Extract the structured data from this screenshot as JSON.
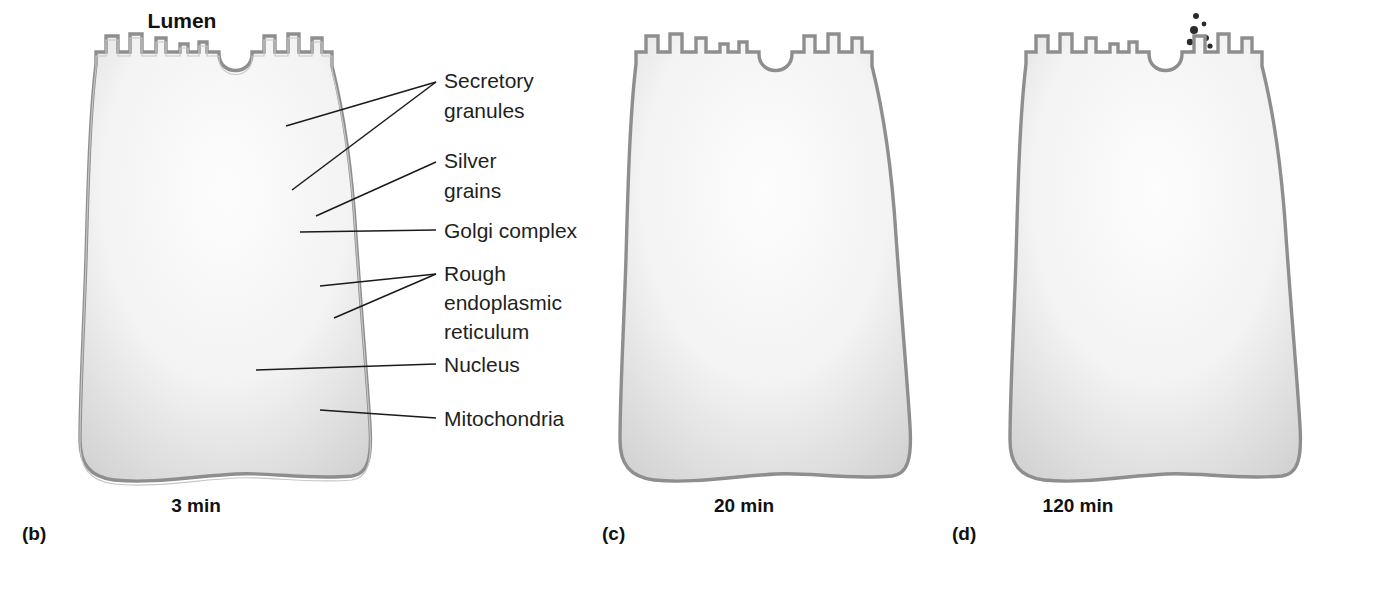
{
  "figure": {
    "lumen_title": "Lumen",
    "background_color": "#ffffff"
  },
  "callouts": [
    {
      "id": "secretory-granules",
      "lines": [
        "Secretory",
        "granules"
      ],
      "x": 444,
      "y": 88
    },
    {
      "id": "silver-grains",
      "lines": [
        "Silver",
        "grains"
      ],
      "x": 444,
      "y": 168
    },
    {
      "id": "golgi-complex",
      "lines": [
        "Golgi complex"
      ],
      "x": 444,
      "y": 236
    },
    {
      "id": "rough-er",
      "lines": [
        "Rough",
        "endoplasmic",
        "reticulum"
      ],
      "x": 444,
      "y": 279
    },
    {
      "id": "nucleus",
      "lines": [
        "Nucleus"
      ],
      "x": 444,
      "y": 370
    },
    {
      "id": "mitochondria",
      "lines": [
        "Mitochondria"
      ],
      "x": 444,
      "y": 424
    }
  ],
  "panels": [
    {
      "id": "b",
      "letter": "(b)",
      "time": "3 min",
      "letter_x": 22,
      "letter_y": 540,
      "time_x": 196,
      "time_y": 512
    },
    {
      "id": "c",
      "letter": "(c)",
      "time": "20 min",
      "letter_x": 602,
      "letter_y": 540,
      "time_x": 744,
      "time_y": 512
    },
    {
      "id": "d",
      "letter": "(d)",
      "time": "120 min",
      "letter_x": 952,
      "letter_y": 540,
      "time_x": 1078,
      "time_y": 512
    }
  ],
  "colors": {
    "cytoplasm_light": "#f6f6f6",
    "cytoplasm_edge": "#b9b9b9",
    "membrane_stroke": "#8e8e8e",
    "organelle_fill": "#cdcdcd",
    "organelle_stroke": "#9a9a9a",
    "granule_fill": "#d9d9d9",
    "granule_stroke": "#a5a5a5",
    "nucleus_fill": "#b6b6b6",
    "nucleolus_fill": "#8c8c8c",
    "silver_grain": "#2b2b2b",
    "label_text": "#231f20",
    "leader_line": "#1a1a1a"
  },
  "legend_semantics": {
    "secretory_granules": "Large pale oval vesicles clustered in the apical cytoplasm beneath the lumen",
    "silver_grains": "Small dense black autoradiographic deposits marking radiolabeled protein",
    "golgi_complex": "Stacked curved cisternae with associated irregular vesicles, supranuclear",
    "rough_endoplasmic_reticulum": "Branching tubules studded with ribosome dots, filling the basal cytoplasm",
    "nucleus": "Large round basal organelle containing an irregular dark nucleolus",
    "mitochondria": "Elongated organelles with internal cristae"
  },
  "stage_data": {
    "b": {
      "time": "3 min",
      "grain_location": "rough endoplasmic reticulum (basal cytoplasm)",
      "grain_count": 14
    },
    "c": {
      "time": "20 min",
      "grain_location": "Golgi complex (supranuclear region)",
      "grain_count": 22
    },
    "d": {
      "time": "120 min",
      "grain_location": "secretory granules and lumen (exocytosis)",
      "grain_count": 28
    }
  }
}
